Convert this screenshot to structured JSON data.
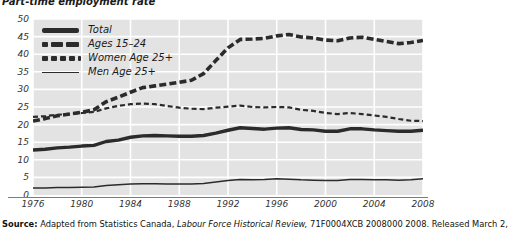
{
  "chart_data": {
    "type": "line",
    "title": "Part-time employment rate",
    "xlabel": "",
    "ylabel": "",
    "ylim": [
      0,
      50
    ],
    "ytick_step": 5,
    "yticks": [
      "50",
      "45",
      "40",
      "35",
      "30",
      "25",
      "20",
      "15",
      "10",
      "5",
      "0"
    ],
    "xticks": [
      "1976",
      "1980",
      "1984",
      "1988",
      "1992",
      "1996",
      "2000",
      "2004",
      "2008"
    ],
    "xlim": [
      1976,
      2008
    ],
    "grid": true,
    "grid_color": "#ffffff",
    "plot_background": "#e3e3e3",
    "legend_position": "top-left",
    "x": [
      1976,
      1977,
      1978,
      1979,
      1980,
      1981,
      1982,
      1983,
      1984,
      1985,
      1986,
      1987,
      1988,
      1989,
      1990,
      1991,
      1992,
      1993,
      1994,
      1995,
      1996,
      1997,
      1998,
      1999,
      2000,
      2001,
      2002,
      2003,
      2004,
      2005,
      2006,
      2007,
      2008
    ],
    "series": [
      {
        "name": "Total",
        "style": "thick-solid",
        "color": "#2b2b2b",
        "values": [
          12.8,
          13.0,
          13.4,
          13.6,
          13.9,
          14.1,
          15.2,
          15.6,
          16.4,
          16.8,
          16.9,
          16.8,
          16.7,
          16.7,
          16.9,
          17.6,
          18.4,
          19.1,
          18.9,
          18.7,
          19.0,
          19.1,
          18.6,
          18.5,
          18.1,
          18.1,
          18.8,
          18.8,
          18.5,
          18.3,
          18.1,
          18.1,
          18.4
        ]
      },
      {
        "name": "Ages 15–24",
        "style": "thick-dashed",
        "color": "#2b2b2b",
        "values": [
          21.0,
          21.7,
          22.5,
          23.0,
          23.5,
          24.2,
          26.5,
          27.8,
          29.2,
          30.5,
          31.0,
          31.5,
          32.0,
          32.6,
          34.5,
          38.2,
          41.8,
          44.2,
          44.3,
          44.5,
          45.2,
          45.6,
          44.9,
          44.6,
          44.0,
          43.8,
          44.6,
          44.8,
          44.2,
          43.6,
          43.0,
          43.3,
          43.9
        ]
      },
      {
        "name": "Women Age 25+",
        "style": "thin-dashed",
        "color": "#2b2b2b",
        "values": [
          22.2,
          22.4,
          22.8,
          23.0,
          23.3,
          23.6,
          24.6,
          25.3,
          25.8,
          26.0,
          25.8,
          25.3,
          24.8,
          24.5,
          24.4,
          24.8,
          25.1,
          25.4,
          25.0,
          24.9,
          25.0,
          24.9,
          24.2,
          23.9,
          23.3,
          23.0,
          23.3,
          23.0,
          22.6,
          22.2,
          21.6,
          21.1,
          21.0
        ]
      },
      {
        "name": "Men Age 25+",
        "style": "thin-solid",
        "color": "#2b2b2b",
        "values": [
          2.0,
          2.0,
          2.1,
          2.1,
          2.2,
          2.3,
          2.7,
          2.9,
          3.1,
          3.2,
          3.2,
          3.1,
          3.1,
          3.1,
          3.3,
          3.7,
          4.1,
          4.4,
          4.3,
          4.4,
          4.6,
          4.5,
          4.3,
          4.2,
          4.1,
          4.1,
          4.4,
          4.4,
          4.3,
          4.3,
          4.2,
          4.3,
          4.6
        ]
      }
    ]
  },
  "legend": {
    "items": [
      {
        "label": "Total",
        "key": "thick-solid"
      },
      {
        "label": "Ages 15–24",
        "key": "thick-dashed"
      },
      {
        "label": "Women Age 25+",
        "key": "thin-dashed"
      },
      {
        "label": "Men Age 25+",
        "key": "thin-solid"
      }
    ]
  },
  "source": {
    "prefix": "Source:",
    "text_1": " Adapted from Statistics Canada, ",
    "publication": "Labour Force Historical Review,",
    "text_2": " 71F0004XCB 2008000 2008. Released March 2,"
  }
}
